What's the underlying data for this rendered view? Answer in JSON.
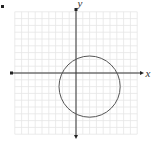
{
  "chart_data": {
    "type": "scatter",
    "title": "",
    "xlabel": "x",
    "ylabel": "y",
    "grid": true,
    "grid_units": {
      "x": [
        -9,
        9
      ],
      "y": [
        -9,
        9
      ]
    },
    "xlim": [
      -9,
      9
    ],
    "ylim": [
      -9,
      9
    ],
    "tick_labels": {
      "x": [],
      "y": []
    },
    "axes_arrows": true,
    "legend": null,
    "shapes": [
      {
        "kind": "circle",
        "center": [
          2,
          -2
        ],
        "radius": 4.5,
        "stroke": "#555555"
      }
    ]
  },
  "axes": {
    "x_label": "x",
    "y_label": "y"
  },
  "colors": {
    "grid": "#e6e6e6",
    "axis": "#333333",
    "circle": "#555555",
    "background": "#ffffff"
  }
}
